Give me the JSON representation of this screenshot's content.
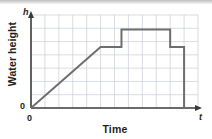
{
  "figure": {
    "background_color": "#ffffff",
    "top_band_color": "#c6c6c6"
  },
  "labels": {
    "ylabel": "Water height",
    "xlabel": "Time",
    "y_axis_symbol": "h",
    "x_axis_symbol": "t",
    "y_origin_tick": "0",
    "x_origin_tick": "0"
  },
  "chart_data": {
    "type": "line",
    "title": "",
    "subtitle": "",
    "xlabel": "Time",
    "ylabel": "Water height",
    "x_axis_symbol": "t",
    "y_axis_symbol": "h",
    "xlim": [
      0,
      12
    ],
    "ylim": [
      0,
      7
    ],
    "xticks": [
      0,
      1,
      2,
      3,
      4,
      5,
      6,
      7,
      8,
      9,
      10,
      11,
      12
    ],
    "yticks": [
      0,
      1,
      2,
      3,
      4,
      5,
      6,
      7
    ],
    "xticklabels": [
      "0",
      "",
      "",
      "",
      "",
      "",
      "",
      "",
      "",
      "",
      "",
      "",
      ""
    ],
    "yticklabels": [
      "0",
      "",
      "",
      "",
      "",
      "",
      "",
      ""
    ],
    "grid": true,
    "grid_color": "#c9cdd4",
    "axis_color": "#3a3a3a",
    "legend": false,
    "legend_position": "none",
    "series": [
      {
        "name": "Water height over time",
        "color": "#6e6e6e",
        "line_width": 2,
        "x": [
          0,
          5,
          6.5,
          6.5,
          10,
          10,
          11,
          11
        ],
        "y": [
          0,
          4.6,
          4.6,
          5.9,
          5.9,
          4.6,
          4.6,
          0
        ]
      }
    ],
    "annotations": [
      {
        "text": "linear rise from origin",
        "x": 2.5,
        "y": 2.3
      },
      {
        "text": "plateau",
        "x": 5.75,
        "y": 4.6
      },
      {
        "text": "step up to higher plateau",
        "x": 8.25,
        "y": 5.9
      },
      {
        "text": "step down",
        "x": 10.5,
        "y": 4.6
      },
      {
        "text": "vertical drop to zero",
        "x": 11,
        "y": 2.3
      }
    ]
  }
}
